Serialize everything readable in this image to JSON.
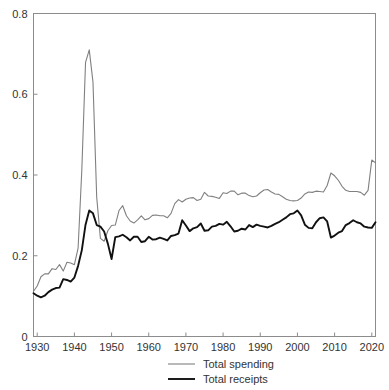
{
  "chart_data": {
    "type": "line",
    "title": "",
    "subtitle": "",
    "xlabel": "",
    "ylabel": "",
    "xlim": [
      1929,
      2021
    ],
    "ylim": [
      0,
      0.8
    ],
    "grid": false,
    "legend_position": "bottom",
    "xticks": [
      1930,
      1940,
      1950,
      1960,
      1970,
      1980,
      1990,
      2000,
      2010,
      2020
    ],
    "xtick_labels": [
      "1930",
      "1940",
      "1950",
      "1960",
      "1970",
      "1980",
      "1990",
      "2000",
      "2010",
      "2020"
    ],
    "yticks": [
      0,
      0.2,
      0.4,
      0.6,
      0.8
    ],
    "ytick_labels": [
      "0",
      "0.2",
      "0.4",
      "0.6",
      "0.8"
    ],
    "x": [
      1929,
      1930,
      1931,
      1932,
      1933,
      1934,
      1935,
      1936,
      1937,
      1938,
      1939,
      1940,
      1941,
      1942,
      1943,
      1944,
      1945,
      1946,
      1947,
      1948,
      1949,
      1950,
      1951,
      1952,
      1953,
      1954,
      1955,
      1956,
      1957,
      1958,
      1959,
      1960,
      1961,
      1962,
      1963,
      1964,
      1965,
      1966,
      1967,
      1968,
      1969,
      1970,
      1971,
      1972,
      1973,
      1974,
      1975,
      1976,
      1977,
      1978,
      1979,
      1980,
      1981,
      1982,
      1983,
      1984,
      1985,
      1986,
      1987,
      1988,
      1989,
      1990,
      1991,
      1992,
      1993,
      1994,
      1995,
      1996,
      1997,
      1998,
      1999,
      2000,
      2001,
      2002,
      2003,
      2004,
      2005,
      2006,
      2007,
      2008,
      2009,
      2010,
      2011,
      2012,
      2013,
      2014,
      2015,
      2016,
      2017,
      2018,
      2019,
      2020,
      2021
    ],
    "series": [
      {
        "name": "Total spending",
        "color": "#808080",
        "width": 1.1,
        "values": [
          0.112,
          0.125,
          0.148,
          0.155,
          0.155,
          0.168,
          0.166,
          0.178,
          0.162,
          0.184,
          0.182,
          0.178,
          0.219,
          0.413,
          0.679,
          0.71,
          0.63,
          0.345,
          0.243,
          0.236,
          0.262,
          0.275,
          0.276,
          0.312,
          0.324,
          0.299,
          0.286,
          0.281,
          0.289,
          0.299,
          0.289,
          0.292,
          0.3,
          0.301,
          0.299,
          0.299,
          0.294,
          0.305,
          0.329,
          0.339,
          0.333,
          0.34,
          0.343,
          0.344,
          0.337,
          0.34,
          0.357,
          0.348,
          0.347,
          0.345,
          0.342,
          0.356,
          0.354,
          0.36,
          0.36,
          0.351,
          0.355,
          0.355,
          0.349,
          0.346,
          0.348,
          0.356,
          0.363,
          0.364,
          0.358,
          0.353,
          0.352,
          0.346,
          0.34,
          0.337,
          0.336,
          0.337,
          0.343,
          0.353,
          0.358,
          0.357,
          0.36,
          0.359,
          0.358,
          0.374,
          0.405,
          0.398,
          0.387,
          0.372,
          0.362,
          0.359,
          0.359,
          0.359,
          0.357,
          0.35,
          0.362,
          0.437,
          0.43
        ]
      },
      {
        "name": "Total receipts",
        "color": "#111111",
        "width": 1.9,
        "values": [
          0.107,
          0.101,
          0.097,
          0.101,
          0.11,
          0.116,
          0.12,
          0.121,
          0.142,
          0.14,
          0.136,
          0.146,
          0.175,
          0.214,
          0.277,
          0.312,
          0.305,
          0.276,
          0.272,
          0.26,
          0.23,
          0.192,
          0.246,
          0.248,
          0.252,
          0.246,
          0.238,
          0.247,
          0.247,
          0.234,
          0.236,
          0.247,
          0.24,
          0.241,
          0.245,
          0.242,
          0.238,
          0.249,
          0.251,
          0.255,
          0.288,
          0.275,
          0.261,
          0.268,
          0.271,
          0.28,
          0.262,
          0.263,
          0.272,
          0.274,
          0.279,
          0.277,
          0.284,
          0.273,
          0.26,
          0.262,
          0.267,
          0.265,
          0.276,
          0.271,
          0.277,
          0.274,
          0.272,
          0.27,
          0.274,
          0.279,
          0.283,
          0.289,
          0.295,
          0.303,
          0.305,
          0.312,
          0.3,
          0.277,
          0.269,
          0.268,
          0.283,
          0.293,
          0.295,
          0.285,
          0.245,
          0.25,
          0.257,
          0.261,
          0.276,
          0.281,
          0.288,
          0.283,
          0.28,
          0.272,
          0.27,
          0.269,
          0.283
        ]
      }
    ],
    "legend": [
      {
        "label": "Total spending",
        "color": "#808080",
        "width": 1.1
      },
      {
        "label": "Total receipts",
        "color": "#111111",
        "width": 1.9
      }
    ],
    "axes": {
      "frame_color": "#8c8c8c",
      "background": "#ffffff"
    }
  }
}
